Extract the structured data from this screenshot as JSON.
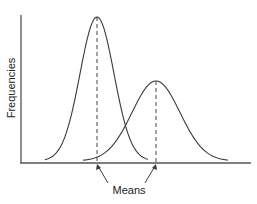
{
  "chart_data": {
    "type": "line",
    "title": "",
    "xlabel": "",
    "ylabel": "Frequencies",
    "grid": false,
    "legend": null,
    "annotations": [
      {
        "text": "Means",
        "points_to": [
          "mean of left distribution",
          "mean of right distribution"
        ]
      }
    ],
    "series": [
      {
        "name": "distribution-1",
        "shape": "normal",
        "mean_x_px": 97,
        "peak_y_px": 17,
        "sigma_px": 17,
        "relative_height": 1.0
      },
      {
        "name": "distribution-2",
        "shape": "normal",
        "mean_x_px": 156,
        "peak_y_px": 81,
        "sigma_px": 24,
        "relative_height": 0.56
      }
    ]
  },
  "labels": {
    "y_axis": "Frequencies",
    "means": "Means"
  }
}
